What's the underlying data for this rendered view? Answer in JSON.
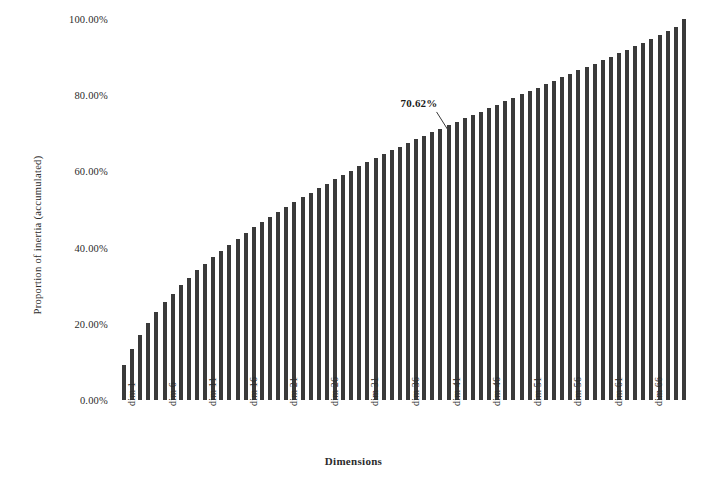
{
  "chart_data": {
    "type": "bar",
    "title": "",
    "subtitle": "",
    "xlabel": "Dimensions",
    "ylabel": "Proportion of inertia (accumulated)",
    "ylim": [
      0,
      1.0
    ],
    "grid": false,
    "legend": "none",
    "bar_color": "#3a3a3a",
    "n_bars": 70,
    "categories": [
      "dim 1",
      "dim 2",
      "dim 3",
      "dim 4",
      "dim 5",
      "dim 6",
      "dim 7",
      "dim 8",
      "dim 9",
      "dim 10",
      "dim 11",
      "dim 12",
      "dim 13",
      "dim 14",
      "dim 15",
      "dim 16",
      "dim 17",
      "dim 18",
      "dim 19",
      "dim 20",
      "dim 21",
      "dim 22",
      "dim 23",
      "dim 24",
      "dim 25",
      "dim 26",
      "dim 27",
      "dim 28",
      "dim 29",
      "dim 30",
      "dim 31",
      "dim 32",
      "dim 33",
      "dim 34",
      "dim 35",
      "dim 36",
      "dim 37",
      "dim 38",
      "dim 39",
      "dim 40",
      "dim 41",
      "dim 42",
      "dim 43",
      "dim 44",
      "dim 45",
      "dim 46",
      "dim 47",
      "dim 48",
      "dim 49",
      "dim 50",
      "dim 51",
      "dim 52",
      "dim 53",
      "dim 54",
      "dim 55",
      "dim 56",
      "dim 57",
      "dim 58",
      "dim 59",
      "dim 60",
      "dim 61",
      "dim 62",
      "dim 63",
      "dim 64",
      "dim 65",
      "dim 66",
      "dim 67",
      "dim 68",
      "dim 69",
      "dim 70"
    ],
    "values": [
      0.0915,
      0.134,
      0.17,
      0.202,
      0.23,
      0.256,
      0.279,
      0.301,
      0.321,
      0.34,
      0.358,
      0.375,
      0.391,
      0.407,
      0.423,
      0.438,
      0.453,
      0.467,
      0.481,
      0.494,
      0.507,
      0.52,
      0.532,
      0.544,
      0.556,
      0.568,
      0.58,
      0.591,
      0.602,
      0.613,
      0.624,
      0.635,
      0.645,
      0.655,
      0.665,
      0.675,
      0.685,
      0.694,
      0.703,
      0.712,
      0.721,
      0.73,
      0.739,
      0.748,
      0.757,
      0.766,
      0.775,
      0.784,
      0.793,
      0.802,
      0.811,
      0.82,
      0.829,
      0.838,
      0.847,
      0.856,
      0.865,
      0.874,
      0.883,
      0.892,
      0.901,
      0.91,
      0.919,
      0.928,
      0.937,
      0.947,
      0.957,
      0.968,
      0.98,
      1.0
    ],
    "y_tick_labels": [
      "0.00%",
      "20.00%",
      "40.00%",
      "60.00%",
      "80.00%",
      "100.00%"
    ],
    "y_tick_values": [
      0.0,
      0.2,
      0.4,
      0.6,
      0.8,
      1.0
    ],
    "x_tick_labels": [
      "dim 1",
      "dim 6",
      "dim 11",
      "dim 16",
      "dim 21",
      "dim 26",
      "dim 31",
      "dim 36",
      "dim 41",
      "dim 46",
      "dim 51",
      "dim 56",
      "dim 61",
      "dim 66"
    ],
    "x_tick_indices": [
      0,
      5,
      10,
      15,
      20,
      25,
      30,
      35,
      40,
      45,
      50,
      55,
      60,
      65
    ],
    "annotations": [
      {
        "text": "70.62%",
        "value": 0.7062,
        "dimension_index": 40,
        "dimension_label": "dim 41"
      }
    ]
  }
}
